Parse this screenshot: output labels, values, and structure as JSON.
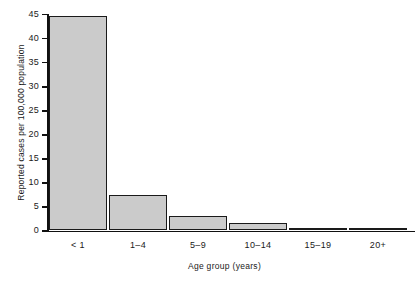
{
  "chart_data": {
    "type": "bar",
    "title": "",
    "subtitle": "",
    "xlabel": "Age group (years)",
    "ylabel": "Reported cases per 100,000 population",
    "categories": [
      "< 1",
      "1–4",
      "5–9",
      "10–14",
      "15–19",
      "20+"
    ],
    "values": [
      44.6,
      7.3,
      3.0,
      1.6,
      0.6,
      0.2
    ],
    "ylim": [
      0,
      45
    ],
    "yticks": [
      0,
      5,
      10,
      15,
      20,
      25,
      30,
      35,
      40,
      45
    ],
    "ytick_labels": [
      "0",
      "5",
      "10",
      "15",
      "20",
      "25",
      "30",
      "35",
      "40",
      "45"
    ],
    "grid": false,
    "legend": null,
    "bar_fill_color": "#cbcbcb",
    "bar_edge_color": "#1a1a1a",
    "axis_color": "#111111",
    "background_color": "#ffffff",
    "series": [
      {
        "name": "Reported cases per 100,000 population",
        "values": [
          44.6,
          7.3,
          3.0,
          1.6,
          0.6,
          0.2
        ]
      }
    ]
  }
}
